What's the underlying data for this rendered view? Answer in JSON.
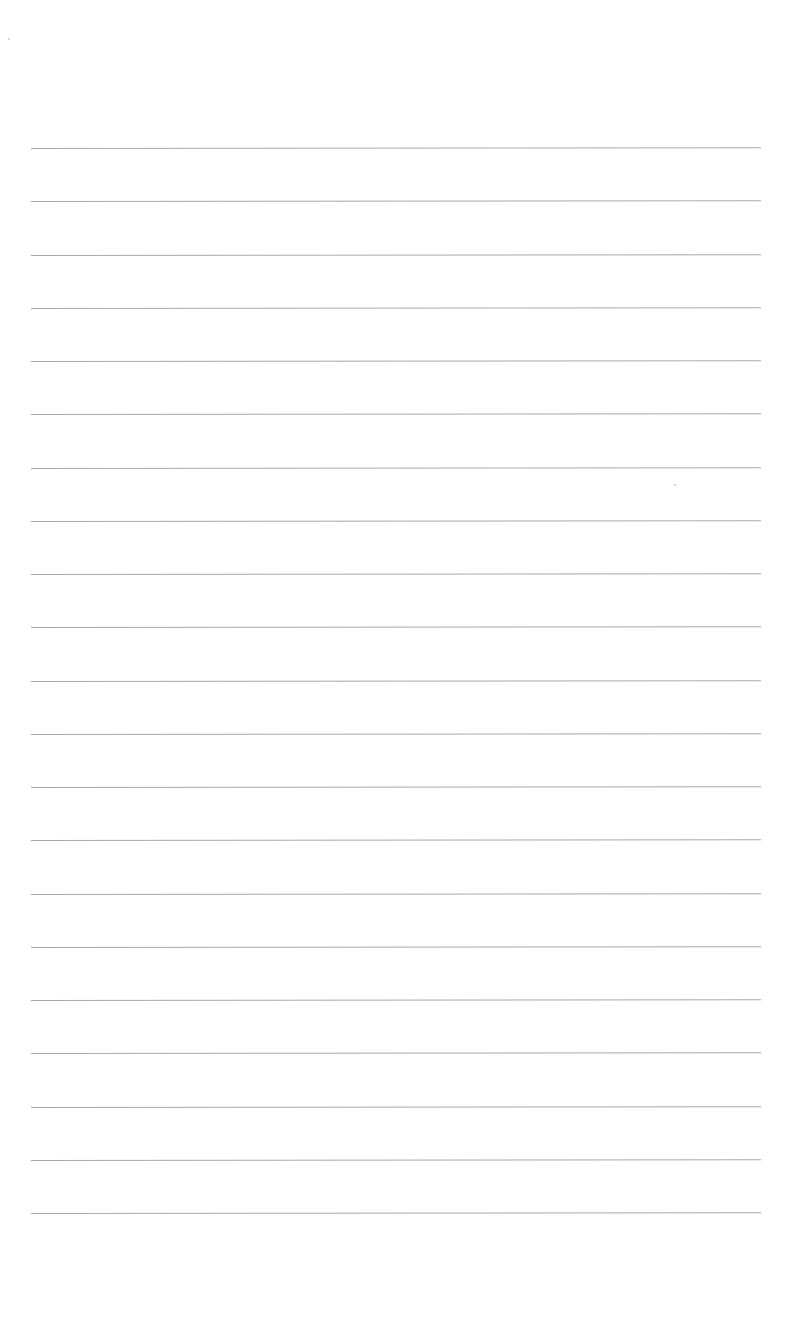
{
  "page": {
    "type": "lined-paper",
    "background_color": "#ffffff",
    "line_color": "#a9a9a9",
    "line_count": 21,
    "first_line_y": 148,
    "line_spacing": 53.25,
    "line_left_x": 31,
    "line_right_x": 761,
    "text": ""
  }
}
